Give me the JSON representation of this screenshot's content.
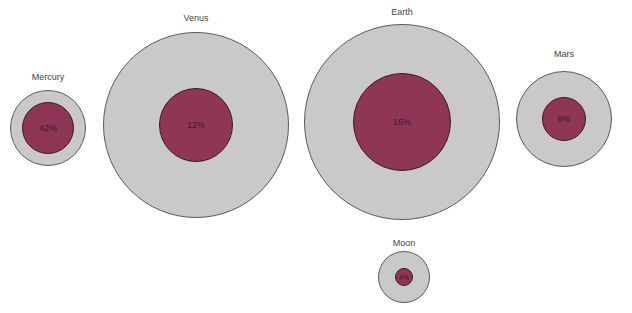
{
  "colors": {
    "outer_fill": "#c9c9c9",
    "outer_stroke": "#5a5a5a",
    "inner_fill": "#8f3656",
    "inner_stroke": "#3a1a24",
    "label": "#444444"
  },
  "planets": [
    {
      "name": "Mercury",
      "percent": "42%",
      "cx": 48,
      "cy": 128,
      "r_outer": 38,
      "r_inner": 26,
      "label_y": 72
    },
    {
      "name": "Venus",
      "percent": "12%",
      "cx": 196,
      "cy": 125,
      "r_outer": 93,
      "r_inner": 37,
      "label_y": 13
    },
    {
      "name": "Earth",
      "percent": "16%",
      "cx": 402,
      "cy": 122,
      "r_outer": 98,
      "r_inner": 49,
      "label_y": 7
    },
    {
      "name": "Mars",
      "percent": "9%",
      "cx": 564,
      "cy": 119,
      "r_outer": 48,
      "r_inner": 22,
      "label_y": 49
    },
    {
      "name": "Moon",
      "percent": "4%",
      "cx": 404,
      "cy": 277,
      "r_outer": 26,
      "r_inner": 9,
      "label_y": 238
    }
  ]
}
